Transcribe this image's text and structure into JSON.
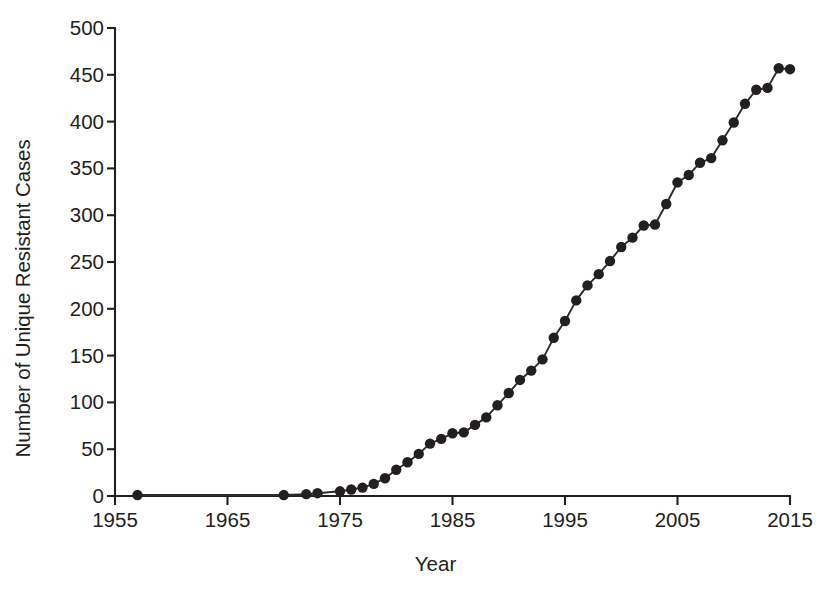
{
  "chart_data": {
    "type": "line",
    "title": "",
    "xlabel": "Year",
    "ylabel": "Number of Unique Resistant Cases",
    "xlim": [
      1955,
      2015
    ],
    "ylim": [
      0,
      500
    ],
    "xticks": [
      1955,
      1965,
      1975,
      1985,
      1995,
      2005,
      2015
    ],
    "xtick_labels": [
      "1955",
      "1965",
      "1975",
      "1985",
      "1995",
      "2005",
      "2015"
    ],
    "yticks": [
      0,
      50,
      100,
      150,
      200,
      250,
      300,
      350,
      400,
      450,
      500
    ],
    "ytick_labels": [
      "0",
      "50",
      "100",
      "150",
      "200",
      "250",
      "300",
      "350",
      "400",
      "450",
      "500"
    ],
    "grid": false,
    "legend": false,
    "marker": "circle",
    "marker_color": "#231f20",
    "line_color": "#2b2b2b",
    "x": [
      1957,
      1970,
      1972,
      1973,
      1975,
      1976,
      1977,
      1978,
      1979,
      1980,
      1981,
      1982,
      1983,
      1984,
      1985,
      1986,
      1987,
      1988,
      1989,
      1990,
      1991,
      1992,
      1993,
      1994,
      1995,
      1996,
      1997,
      1998,
      1999,
      2000,
      2001,
      2002,
      2003,
      2004,
      2005,
      2006,
      2007,
      2008,
      2009,
      2010,
      2011,
      2012,
      2013,
      2014,
      2015
    ],
    "y": [
      1,
      1,
      2,
      3,
      5,
      7,
      9,
      13,
      19,
      28,
      36,
      45,
      56,
      61,
      67,
      68,
      76,
      84,
      97,
      110,
      124,
      134,
      146,
      169,
      187,
      209,
      225,
      237,
      251,
      266,
      276,
      289,
      290,
      312,
      335,
      343,
      356,
      361,
      380,
      399,
      419,
      434,
      436,
      457,
      456
    ],
    "series": [
      {
        "name": "Unique Resistant Cases",
        "values": [
          1,
          1,
          2,
          3,
          5,
          7,
          9,
          13,
          19,
          28,
          36,
          45,
          56,
          61,
          67,
          68,
          76,
          84,
          97,
          110,
          124,
          134,
          146,
          169,
          187,
          209,
          225,
          237,
          251,
          266,
          276,
          289,
          290,
          312,
          335,
          343,
          356,
          361,
          380,
          399,
          419,
          434,
          436,
          457,
          456
        ]
      }
    ]
  }
}
